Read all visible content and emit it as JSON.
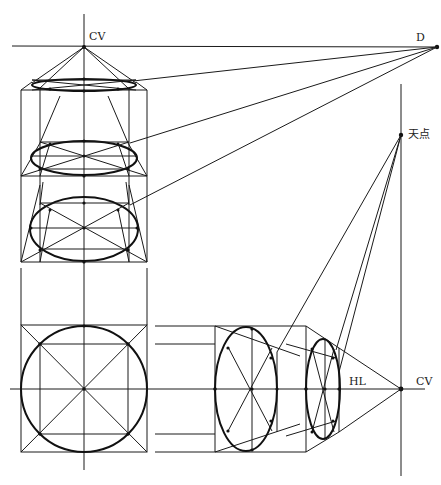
{
  "labels": {
    "cv_top": "CV",
    "d": "D",
    "tiandian": "天点",
    "hl": "HL",
    "cv_right": "CV"
  },
  "colors": {
    "ink": "#111111",
    "background": "#ffffff"
  },
  "points": {
    "cv_top": [
      84,
      47
    ],
    "d": [
      437,
      47
    ],
    "tiandian": [
      401,
      135
    ],
    "cv_right": [
      401,
      389
    ]
  }
}
